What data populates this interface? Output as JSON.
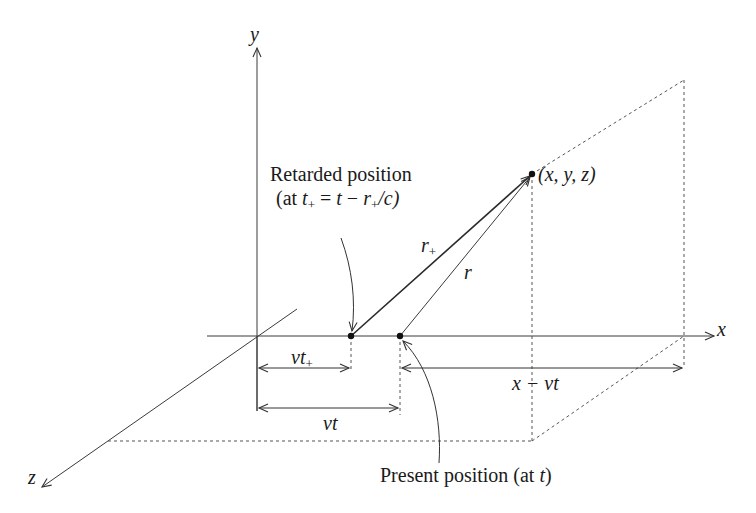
{
  "figure": {
    "axes": {
      "x_label": "x",
      "y_label": "y",
      "z_label": "z"
    },
    "points": {
      "field_point": "(x, y, z)",
      "retarded_label_line1": "Retarded position",
      "retarded_label_line2_prefix": "(at ",
      "retarded_label_line2_t": "t",
      "retarded_label_line2_sub": "+",
      "retarded_label_line2_eq": " = ",
      "retarded_label_line2_t2": "t",
      "retarded_label_line2_minus": " − ",
      "retarded_label_line2_r": "r",
      "retarded_label_line2_rsub": "+",
      "retarded_label_line2_tail": "/c)",
      "present_label_prefix": "Present position (at ",
      "present_label_t": "t",
      "present_label_suffix": ")"
    },
    "distances": {
      "r_plus": "r",
      "r_plus_sub": "+",
      "r": "r"
    },
    "dimensions": {
      "vt_plus": "vt",
      "vt_plus_sub": "+",
      "vt": "vt",
      "x_minus_vt": "x − vt"
    },
    "colors": {
      "ink": "#1a1a1a",
      "line": "#3a3a3a",
      "dashed": "#555555",
      "background": "#ffffff"
    }
  }
}
